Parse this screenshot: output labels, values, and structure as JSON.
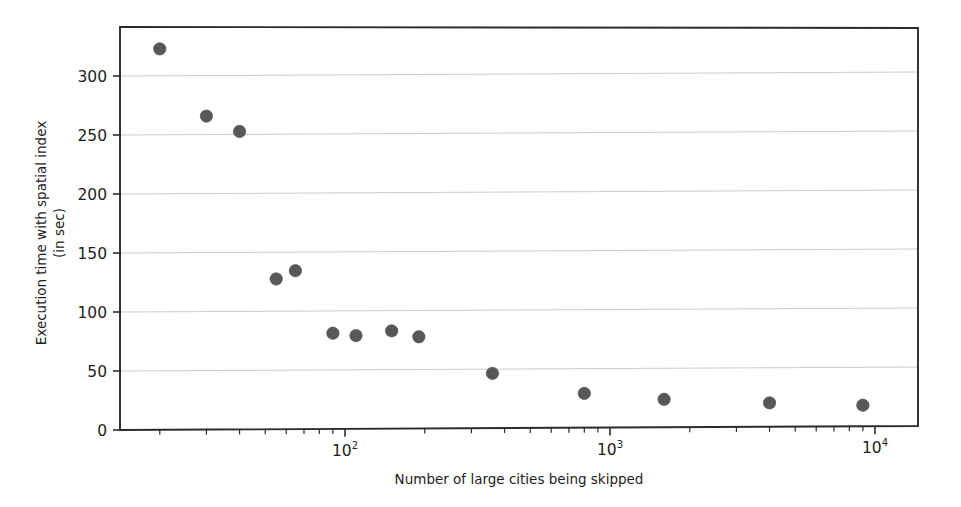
{
  "chart_data": {
    "type": "scatter",
    "title": "",
    "xlabel": "Number of large cities being skipped",
    "ylabel_line1": "Execution time with spatial index",
    "ylabel_line2": "(in sec)",
    "xscale": "log",
    "yscale": "linear",
    "xlim": [
      14,
      17000
    ],
    "ylim": [
      0,
      345
    ],
    "grid": true,
    "legend": null,
    "x_tick_labels": [
      "10",
      "10",
      "10"
    ],
    "x_tick_exponents": [
      "2",
      "3",
      "4"
    ],
    "x_tick_values": [
      100,
      1000,
      10000
    ],
    "y_tick_labels": [
      "0",
      "50",
      "100",
      "150",
      "200",
      "250",
      "300"
    ],
    "y_tick_values": [
      0,
      50,
      100,
      150,
      200,
      250,
      300
    ],
    "marker_color": "#585858",
    "grid_color": "#b9b9bd",
    "axis_color": "#2b2b2b",
    "x": [
      20,
      30,
      40,
      50,
      60,
      70,
      80,
      100,
      200,
      500,
      1000,
      2000,
      5000,
      10000
    ],
    "y": [
      323,
      266,
      253,
      128,
      135,
      82,
      80,
      84,
      79,
      48,
      31,
      26,
      23,
      21
    ],
    "points": [
      {
        "x": 20,
        "y": 323
      },
      {
        "x": 30,
        "y": 266
      },
      {
        "x": 40,
        "y": 253
      },
      {
        "x": 55,
        "y": 128
      },
      {
        "x": 65,
        "y": 135
      },
      {
        "x": 90,
        "y": 82
      },
      {
        "x": 110,
        "y": 80
      },
      {
        "x": 150,
        "y": 84
      },
      {
        "x": 190,
        "y": 79
      },
      {
        "x": 360,
        "y": 48
      },
      {
        "x": 800,
        "y": 31
      },
      {
        "x": 1600,
        "y": 26
      },
      {
        "x": 4000,
        "y": 23
      },
      {
        "x": 9000,
        "y": 21
      }
    ]
  }
}
